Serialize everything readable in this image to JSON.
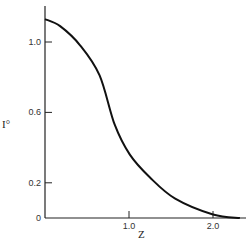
{
  "chart_data": {
    "type": "line",
    "title": "",
    "xlabel": "Z",
    "ylabel": "I°",
    "xlim": [
      0,
      2.4
    ],
    "ylim": [
      0,
      1.2
    ],
    "x_ticks": [
      1.0,
      2.0
    ],
    "x_tick_labels": [
      "1.0",
      "2.0"
    ],
    "y_ticks": [
      0,
      0.2,
      0.6,
      1.0
    ],
    "y_tick_labels": [
      "0",
      "0.2",
      "0.6",
      "1.0"
    ],
    "grid": false,
    "legend": null,
    "series": [
      {
        "name": "I°(Z)",
        "color": "#111111",
        "x": [
          0,
          0.18,
          0.42,
          0.65,
          0.83,
          1.01,
          1.25,
          1.55,
          2.0,
          2.32
        ],
        "y": [
          1.13,
          1.09,
          0.98,
          0.81,
          0.53,
          0.36,
          0.23,
          0.11,
          0.02,
          0.0
        ]
      }
    ]
  }
}
